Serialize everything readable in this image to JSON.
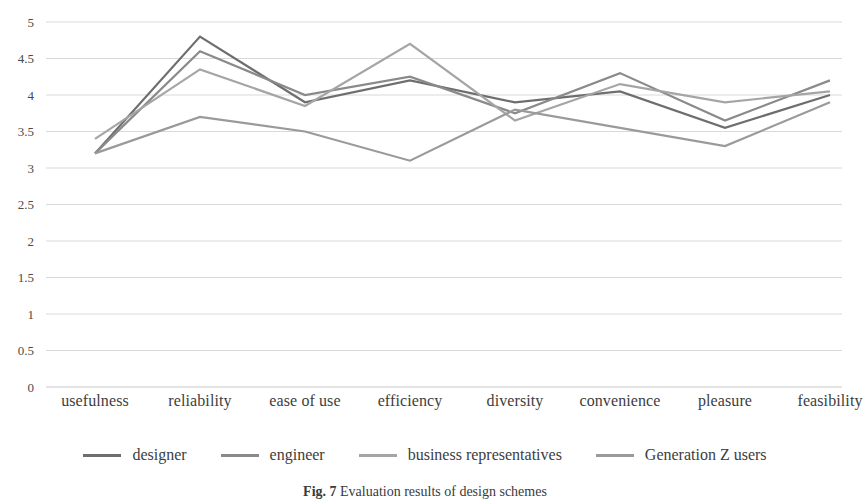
{
  "chart_data": {
    "type": "line",
    "title": "",
    "xlabel": "",
    "ylabel": "",
    "ylim": [
      0,
      5
    ],
    "ytick_step": 0.5,
    "yticks": [
      "5",
      "4.5",
      "4",
      "3.5",
      "3",
      "2.5",
      "2",
      "1.5",
      "1",
      "0.5",
      "0"
    ],
    "grid": true,
    "legend_position": "bottom",
    "categories": [
      "usefulness",
      "reliability",
      "ease of use",
      "efficiency",
      "diversity",
      "convenience",
      "pleasure",
      "feasibility"
    ],
    "series": [
      {
        "name": "designer",
        "color": "#6e6e6e",
        "values": [
          3.2,
          4.8,
          3.9,
          4.2,
          3.9,
          4.05,
          3.55,
          4.0
        ]
      },
      {
        "name": "engineer",
        "color": "#8a8a8a",
        "values": [
          3.2,
          4.6,
          4.0,
          4.25,
          3.75,
          4.3,
          3.65,
          4.2
        ]
      },
      {
        "name": "business representatives",
        "color": "#a5a5a5",
        "values": [
          3.4,
          4.35,
          3.85,
          4.7,
          3.65,
          4.15,
          3.9,
          4.05
        ]
      },
      {
        "name": "Generation Z users",
        "color": "#9a9a9a",
        "values": [
          3.2,
          3.7,
          3.5,
          3.1,
          3.8,
          3.55,
          3.3,
          3.9
        ]
      }
    ]
  },
  "caption": {
    "figure_number": "Fig. 7",
    "text": "Evaluation results of design schemes"
  },
  "colors": {
    "gridline": "#d9d9d9",
    "axis_text": "#4a4a4a",
    "background": "#ffffff"
  }
}
